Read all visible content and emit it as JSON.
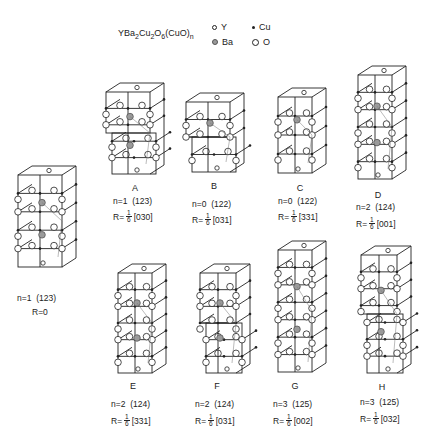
{
  "header": {
    "formula": {
      "base": "YBa",
      "s1": "2",
      "cu": "Cu",
      "s2": "2",
      "o": "O",
      "s3": "6",
      "tail": "(CuO)",
      "s4": "n"
    },
    "legend": [
      {
        "symbol": "small-open-circle",
        "label": "Y"
      },
      {
        "symbol": "small-filled-dot",
        "label": "Cu"
      },
      {
        "symbol": "gray-circle",
        "label": "Ba"
      },
      {
        "symbol": "open-circle",
        "label": "O"
      }
    ]
  },
  "structures": [
    {
      "id": "base",
      "letter": "",
      "n_label": "n=1  (123)",
      "r_prefix": "R=0",
      "r_frac": null,
      "r_vec": "",
      "x": 12,
      "y": 163,
      "layers": 3,
      "shift": false,
      "w": 70,
      "h": 110
    },
    {
      "id": "A",
      "letter": "A",
      "n_label": "n=1  (123)",
      "r_prefix": "R=",
      "r_frac": {
        "num": "1",
        "den": "6"
      },
      "r_vec": "[030]",
      "x": 100,
      "y": 80,
      "layers": 3,
      "shift": true,
      "w": 70,
      "h": 100
    },
    {
      "id": "B",
      "letter": "B",
      "n_label": "n=0  (122)",
      "r_prefix": "R=",
      "r_frac": {
        "num": "1",
        "den": "6"
      },
      "r_vec": "[031]",
      "x": 180,
      "y": 90,
      "layers": 2,
      "shift": true,
      "w": 70,
      "h": 88
    },
    {
      "id": "C",
      "letter": "C",
      "n_label": "n=0  (122)",
      "r_prefix": "R=",
      "r_frac": {
        "num": "1",
        "den": "6"
      },
      "r_vec": "[331]",
      "x": 272,
      "y": 85,
      "layers": 2,
      "shift": false,
      "w": 60,
      "h": 94
    },
    {
      "id": "D",
      "letter": "D",
      "n_label": "n=2  (124)",
      "r_prefix": "R=",
      "r_frac": {
        "num": "1",
        "den": "6"
      },
      "r_vec": "[001]",
      "x": 352,
      "y": 63,
      "layers": 4,
      "shift": false,
      "w": 60,
      "h": 122
    },
    {
      "id": "E",
      "letter": "E",
      "n_label": "n=2  (124)",
      "r_prefix": "R=",
      "r_frac": {
        "num": "1",
        "den": "6"
      },
      "r_vec": "[331]",
      "x": 112,
      "y": 261,
      "layers": 4,
      "shift": false,
      "w": 60,
      "h": 118
    },
    {
      "id": "F",
      "letter": "F",
      "n_label": "n=2  (124)",
      "r_prefix": "R=",
      "r_frac": {
        "num": "1",
        "den": "6"
      },
      "r_vec": "[031]",
      "x": 194,
      "y": 261,
      "layers": 4,
      "shift": true,
      "w": 62,
      "h": 118
    },
    {
      "id": "G",
      "letter": "G",
      "n_label": "n=3  (125)",
      "r_prefix": "R=",
      "r_frac": {
        "num": "1",
        "den": "6"
      },
      "r_vec": "[002]",
      "x": 272,
      "y": 238,
      "layers": 5,
      "shift": false,
      "w": 60,
      "h": 140
    },
    {
      "id": "H",
      "letter": "H",
      "n_label": "n=3  (125)",
      "r_prefix": "R=",
      "r_frac": {
        "num": "1",
        "den": "6"
      },
      "r_vec": "[032]",
      "x": 355,
      "y": 243,
      "layers": 5,
      "shift": true,
      "w": 62,
      "h": 136
    }
  ],
  "label_positions": {
    "base": {
      "letter_y": 0,
      "n_x": 17,
      "n_y": 293,
      "r_x": 32,
      "r_y": 307
    },
    "A": {
      "letter_y": 183,
      "n_x": 113,
      "n_y": 196,
      "r_x": 113,
      "r_y": 210
    },
    "B": {
      "letter_y": 181,
      "n_x": 192,
      "n_y": 199,
      "r_x": 192,
      "r_y": 213
    },
    "C": {
      "letter_y": 183,
      "n_x": 278,
      "n_y": 196,
      "r_x": 278,
      "r_y": 210
    },
    "D": {
      "letter_y": 190,
      "n_x": 356,
      "n_y": 202,
      "r_x": 356,
      "r_y": 217
    },
    "E": {
      "letter_y": 381,
      "n_x": 111,
      "n_y": 399,
      "r_x": 111,
      "r_y": 414
    },
    "F": {
      "letter_y": 381,
      "n_x": 195,
      "n_y": 399,
      "r_x": 195,
      "r_y": 414
    },
    "G": {
      "letter_y": 381,
      "n_x": 273,
      "n_y": 399,
      "r_x": 273,
      "r_y": 414
    },
    "H": {
      "letter_y": 382,
      "n_x": 360,
      "n_y": 397,
      "r_x": 360,
      "r_y": 412
    }
  },
  "colors": {
    "line": "#222222",
    "ba_fill": "#9a9a9a",
    "atom_fill": "#ffffff"
  }
}
